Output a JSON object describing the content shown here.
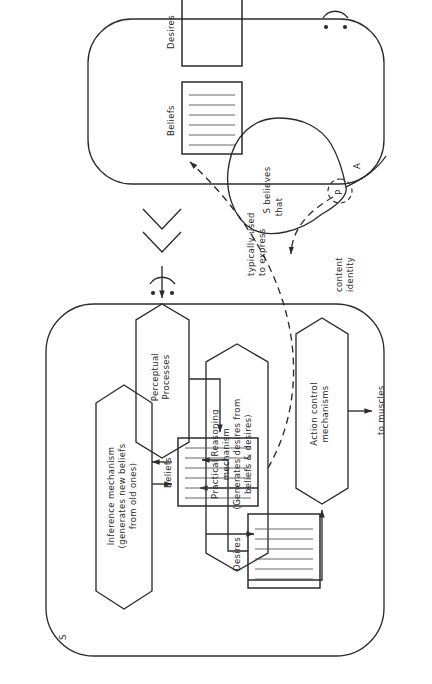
{
  "figure": {
    "type": "diagram",
    "orientation": "rotated-90-ccw"
  },
  "agents": {
    "speaker": {
      "label": "S",
      "name": "speaker-agent",
      "stores": [
        {
          "label": "Beliefs",
          "filled": true
        },
        {
          "label": "Desires",
          "filled": true
        }
      ],
      "mechanisms": [
        {
          "label": "Inference mechanism\n(generates new beliefs\nfrom old ones)",
          "name": "inference-mechanism"
        },
        {
          "label": "Practical Reasoning\nmechanism\n(Generates desires from\nbeliefs & desires)",
          "name": "practical-reasoning-mechanism"
        },
        {
          "label": "Action control\nmechanisms",
          "name": "action-control-mechanisms"
        },
        {
          "label": "Perceptual\nProcesses",
          "name": "perceptual-processes"
        }
      ],
      "output_label": "to muscles",
      "input_symbol": ":)"
    },
    "hearer": {
      "label": "A",
      "name": "hearer-agent",
      "stores": [
        {
          "label": "Beliefs",
          "filled": true
        },
        {
          "label": "Desires",
          "filled": false
        }
      ],
      "input_symbol": ":)"
    }
  },
  "utterance": {
    "name": "speech-bubble",
    "text_line1": "S believes",
    "text_line2": "that",
    "proposition": "P"
  },
  "annotations": [
    {
      "name": "typically-used-to-express",
      "line1": "typically used",
      "line2": "to express"
    },
    {
      "name": "content-identity",
      "line1": "content",
      "line2": "identity"
    }
  ],
  "colors": {
    "ink": "#2b2b2b",
    "hatch": "#555555",
    "paper": "#ffffff"
  }
}
